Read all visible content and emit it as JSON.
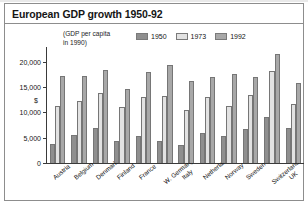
{
  "figure": {
    "title": "European GDP growth 1950-92",
    "axis_note_line1": "(GDP per capita",
    "axis_note_line2": "in 1990)",
    "currency_symbol": "$"
  },
  "legend": {
    "position": "top-right",
    "items": [
      {
        "label": "1950",
        "color": "#8f8f8f"
      },
      {
        "label": "1973",
        "color": "#e2e2e2"
      },
      {
        "label": "1992",
        "color": "#a8a8a8"
      }
    ]
  },
  "axis": {
    "yticks": [
      {
        "value": 20000,
        "label": "20,000"
      },
      {
        "value": 15000,
        "label": "15,000"
      },
      {
        "value": 10000,
        "label": "10,000"
      },
      {
        "value": 5000,
        "label": "5,000"
      },
      {
        "value": 0,
        "label": "0"
      }
    ]
  },
  "chart_data": {
    "type": "bar",
    "title": "European GDP growth 1950-92",
    "subtitle": "(GDP per capita in 1990)",
    "xlabel": "",
    "ylabel": "$",
    "ylim": [
      0,
      22500
    ],
    "grid": false,
    "legend_position": "top-right",
    "categories": [
      "Austria",
      "Belgium",
      "Denmark",
      "Finland",
      "France",
      "W. Germany",
      "Italy",
      "Netherlands",
      "Norway",
      "Sweden",
      "Switzerland",
      "UK"
    ],
    "series": [
      {
        "name": "1950",
        "color": "#8f8f8f",
        "values": [
          3700,
          5500,
          6900,
          4300,
          5300,
          4300,
          3500,
          5900,
          5400,
          6700,
          9000,
          6900
        ]
      },
      {
        "name": "1973",
        "color": "#e2e2e2",
        "values": [
          11200,
          12200,
          13900,
          11000,
          13000,
          13200,
          10400,
          13100,
          11200,
          13500,
          18200,
          11700
        ]
      },
      {
        "name": "1992",
        "color": "#a8a8a8",
        "values": [
          17200,
          17200,
          18300,
          14600,
          17900,
          19400,
          16200,
          16900,
          17500,
          16900,
          21500,
          15700
        ]
      }
    ]
  }
}
